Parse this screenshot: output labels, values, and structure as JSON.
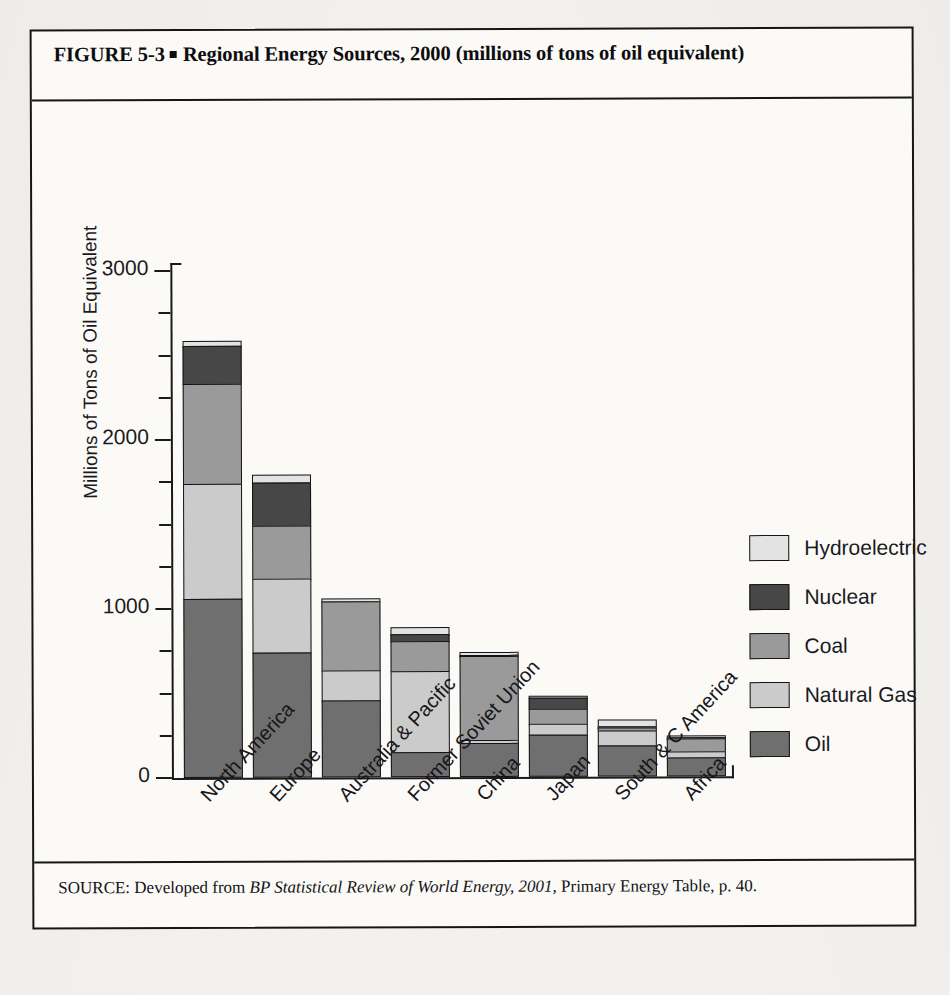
{
  "figure": {
    "title_prefix": "FIGURE  5-3",
    "title_text": "Regional Energy Sources, 2000 (millions of tons of oil equivalent)",
    "source_prefix": "SOURCE: Developed from ",
    "source_italic": "BP Statistical Review of World Energy, 2001,",
    "source_suffix": " Primary Energy Table, p. 40."
  },
  "chart_data": {
    "type": "bar",
    "subtype": "stacked-vertical",
    "title": "Regional Energy Sources, 2000 (millions of tons of oil equivalent)",
    "xlabel": "",
    "ylabel": "Millions of Tons of Oil Equivalent",
    "ylim": [
      0,
      3000
    ],
    "ytick_labels": [
      "0",
      "1000",
      "2000",
      "3000"
    ],
    "ytick_values": [
      0,
      1000,
      2000,
      3000
    ],
    "minor_tick_interval": 250,
    "grid": false,
    "legend_position": "right",
    "categories": [
      "North America",
      "Europe",
      "Australia & Pacific",
      "Former Soviet Union",
      "China",
      "Japan",
      "South & C America",
      "Africa"
    ],
    "series": [
      {
        "name": "Oil",
        "color": "#6f6f6f",
        "values": [
          1060,
          740,
          455,
          150,
          200,
          250,
          185,
          110
        ]
      },
      {
        "name": "Natural Gas",
        "color": "#cbcbcb",
        "values": [
          690,
          445,
          185,
          485,
          25,
          70,
          95,
          45
        ]
      },
      {
        "name": "Coal",
        "color": "#9a9a9a",
        "values": [
          600,
          325,
          420,
          185,
          505,
          100,
          25,
          85
        ]
      },
      {
        "name": "Nuclear",
        "color": "#474747",
        "values": [
          230,
          260,
          0,
          50,
          5,
          75,
          10,
          5
        ]
      },
      {
        "name": "Hydroelectric",
        "color": "#e3e3e3",
        "values": [
          40,
          55,
          25,
          50,
          25,
          20,
          45,
          20
        ]
      }
    ],
    "totals": [
      2620,
      1825,
      1085,
      920,
      760,
      515,
      360,
      265
    ],
    "legend_entries": [
      {
        "label": "Hydroelectric",
        "color": "#e3e3e3"
      },
      {
        "label": "Nuclear",
        "color": "#474747"
      },
      {
        "label": "Coal",
        "color": "#9a9a9a"
      },
      {
        "label": "Natural Gas",
        "color": "#cbcbcb"
      },
      {
        "label": "Oil",
        "color": "#6f6f6f"
      }
    ]
  }
}
